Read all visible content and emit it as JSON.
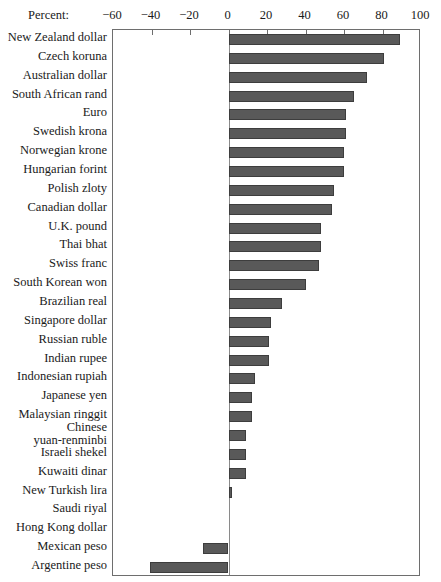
{
  "chart_data": {
    "type": "bar",
    "orientation": "horizontal",
    "title": "",
    "xlabel": "Percent:",
    "ylabel": "",
    "xlim": [
      -60,
      100
    ],
    "grid": false,
    "legend": null,
    "xticks": [
      -60,
      -40,
      -20,
      0,
      20,
      40,
      60,
      80,
      100
    ],
    "xtick_labels": [
      "−60",
      "−40",
      "−20",
      "0",
      "20",
      "40",
      "60",
      "80",
      "100"
    ],
    "categories": [
      "New Zealand dollar",
      "Czech koruna",
      "Australian dollar",
      "South African rand",
      "Euro",
      "Swedish krona",
      "Norwegian krone",
      "Hungarian forint",
      "Polish zloty",
      "Canadian dollar",
      "U.K. pound",
      "Thai bhat",
      "Swiss franc",
      "South Korean won",
      "Brazilian real",
      "Singapore dollar",
      "Russian ruble",
      "Indian rupee",
      "Indonesian rupiah",
      "Japanese yen",
      "Malaysian ringgit",
      "Chinese\nyuan-renminbi",
      "Israeli shekel",
      "Kuwaiti dinar",
      "New Turkish lira",
      "Saudi riyal",
      "Hong Kong dollar",
      "Mexican peso",
      "Argentine peso"
    ],
    "values": [
      89,
      81,
      72,
      65,
      61,
      61,
      60,
      60,
      55,
      54,
      48,
      48,
      47,
      40,
      28,
      22,
      21,
      21,
      14,
      12,
      12,
      9,
      9,
      9,
      2,
      0,
      0,
      -13,
      -41
    ],
    "bar_color": "#595959",
    "bar_edge_color": "#3d3d3d",
    "axis_color": "#6e6e6e"
  }
}
